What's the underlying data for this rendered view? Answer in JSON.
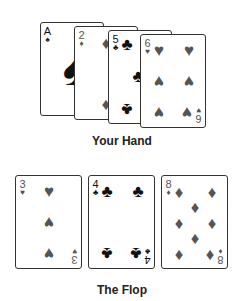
{
  "hand": {
    "label": "Your Hand",
    "cards": [
      {
        "rank": "A",
        "suit": "♠",
        "suit_name": "spades",
        "color": "black"
      },
      {
        "rank": "2",
        "suit": "♦",
        "suit_name": "diamonds",
        "color": "red"
      },
      {
        "rank": "5",
        "suit": "♣",
        "suit_name": "clubs",
        "color": "black"
      },
      {
        "rank": "6",
        "suit": "♥",
        "suit_name": "hearts",
        "color": "red"
      }
    ]
  },
  "flop": {
    "label": "The Flop",
    "cards": [
      {
        "rank": "3",
        "suit": "♥",
        "suit_name": "hearts",
        "color": "red"
      },
      {
        "rank": "4",
        "suit": "♣",
        "suit_name": "clubs",
        "color": "black"
      },
      {
        "rank": "8",
        "suit": "♦",
        "suit_name": "diamonds",
        "color": "red"
      }
    ]
  },
  "colors": {
    "red_suit": "#555555",
    "black_suit": "#111111",
    "border": "#333333"
  }
}
